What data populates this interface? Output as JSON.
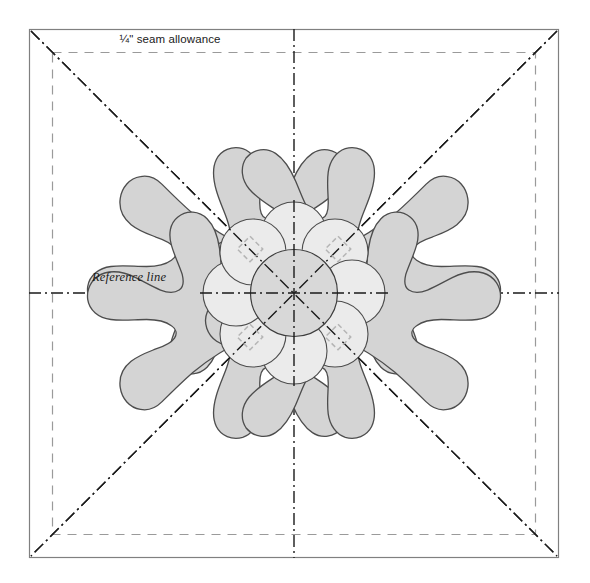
{
  "diagram": {
    "title_hidden": "Applique block placement diagram",
    "labels": {
      "seam_allowance": "¼\" seam allowance",
      "reference_line": "Reference line"
    },
    "colors": {
      "background": "#ffffff",
      "block_border": "#808080",
      "seam_allowance_line": "#9a9a9a",
      "reference_line": "#1a1a1a",
      "leaf_fill": "#d4d4d4",
      "leaf_stroke": "#4d4d4d",
      "petal_fill": "#ebebeb",
      "petal_stroke": "#4d4d4d",
      "center_fill": "#d8d8d8",
      "center_stroke": "#3d3d3d",
      "marker_stroke": "#b5b5b5",
      "text": "#1a1a1a"
    },
    "geometry": {
      "block": {
        "x": 29,
        "y": 29,
        "width": 530,
        "height": 529
      },
      "seam_allowance_inset": 23,
      "center": {
        "x": 294,
        "y": 293
      },
      "center_circle_radius": 43,
      "petal_count": 8,
      "petal_radius": 32,
      "petal_orbit_radius": 58,
      "leaf_count": 4,
      "leaf_angles_deg": [
        225,
        315,
        45,
        135
      ],
      "marker_size": 18,
      "marker_offset": 62
    },
    "elements": {
      "outer_block_name": "block-outline",
      "seam_line_name": "seam-allowance-line",
      "horizontal_reference_name": "horizontal-reference-line",
      "vertical_reference_name": "vertical-reference-line",
      "diagonal_a_name": "diagonal-reference-line-nw-se",
      "diagonal_b_name": "diagonal-reference-line-ne-sw"
    }
  }
}
